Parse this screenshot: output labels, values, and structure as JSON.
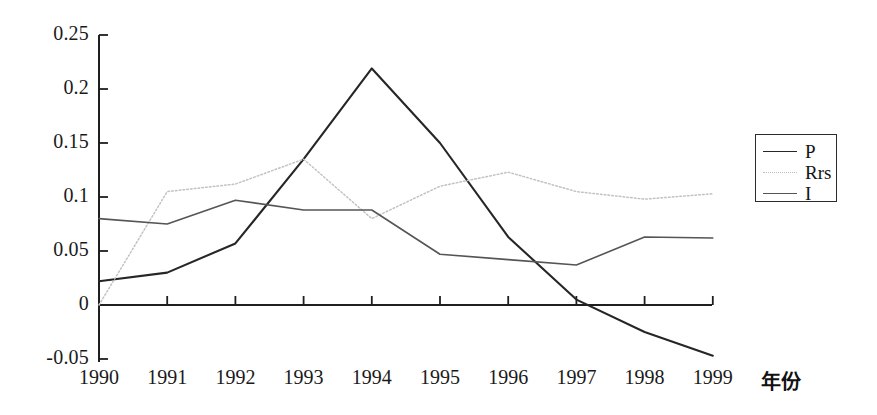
{
  "chart_data": {
    "type": "line",
    "title": "",
    "xlabel": "年份",
    "ylabel": "",
    "x": [
      "1990",
      "1991",
      "1992",
      "1993",
      "1994",
      "1995",
      "1996",
      "1997",
      "1998",
      "1999"
    ],
    "categories": [
      "1990",
      "1991",
      "1992",
      "1993",
      "1994",
      "1995",
      "1996",
      "1997",
      "1998",
      "1999"
    ],
    "series": [
      {
        "name": "P",
        "values": [
          0.022,
          0.03,
          0.057,
          0.135,
          0.219,
          0.15,
          0.063,
          0.005,
          -0.025,
          -0.047
        ],
        "color": "#262626",
        "style": "solid",
        "width": 2.1
      },
      {
        "name": "Rrs",
        "values": [
          0.0,
          0.105,
          0.112,
          0.135,
          0.08,
          0.11,
          0.123,
          0.105,
          0.098,
          0.103
        ],
        "color": "#c2c2c2",
        "style": "dotted",
        "width": 1.5
      },
      {
        "name": "I",
        "values": [
          0.08,
          0.075,
          0.097,
          0.088,
          0.088,
          0.047,
          0.042,
          0.037,
          0.063,
          0.062
        ],
        "color": "#555555",
        "style": "solid",
        "width": 1.6
      }
    ],
    "ylim": [
      -0.05,
      0.25
    ],
    "yticks": [
      -0.05,
      0,
      0.05,
      0.1,
      0.15,
      0.2,
      0.25
    ],
    "ytick_labels": [
      "-0.05",
      "0",
      "0.05",
      "0.1",
      "0.15",
      "0.2",
      "0.25"
    ],
    "grid": false,
    "legend_position": "right-outside",
    "axis_color": "#1f1f1f"
  },
  "legend": {
    "entries": [
      {
        "label": "P",
        "swatch": "solid-dark-line-icon"
      },
      {
        "label": "Rrs",
        "swatch": "dotted-light-line-icon"
      },
      {
        "label": "I",
        "swatch": "solid-mid-line-icon"
      }
    ]
  },
  "axes": {
    "x_axis_title": "年份",
    "y_tick_labels": [
      "0.25",
      "0.2",
      "0.15",
      "0.1",
      "0.05",
      "0",
      "-0.05"
    ],
    "x_tick_labels": [
      "1990",
      "1991",
      "1992",
      "1993",
      "1994",
      "1995",
      "1996",
      "1997",
      "1998",
      "1999"
    ]
  }
}
